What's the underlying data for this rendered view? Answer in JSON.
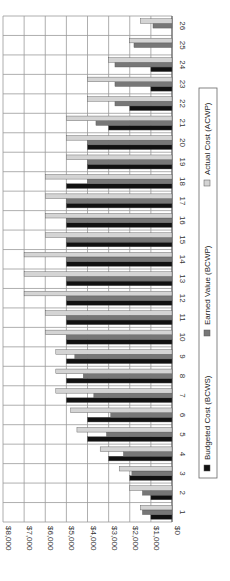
{
  "chart_data": {
    "type": "bar",
    "orientation": "rotated-90-clockwise",
    "title": "",
    "xlabel": "",
    "ylabel": "",
    "ylim": [
      0,
      8000
    ],
    "grid": true,
    "legend_position": "bottom",
    "categories": [
      "1",
      "2",
      "3",
      "4",
      "5",
      "6",
      "7",
      "8",
      "9",
      "10",
      "11",
      "12",
      "13",
      "14",
      "15",
      "16",
      "17",
      "18",
      "19",
      "20",
      "21",
      "22",
      "23",
      "24",
      "25",
      "26"
    ],
    "y_ticks": [
      "$0",
      "$1,000",
      "$2,000",
      "$3,000",
      "$4,000",
      "$5,000",
      "$6,000",
      "$7,000",
      "$8,000"
    ],
    "series": [
      {
        "name": "Budgeted Cost (BCWS)",
        "color": "#111111",
        "values": [
          1000,
          1000,
          2000,
          3000,
          4000,
          4000,
          5000,
          5000,
          5000,
          5000,
          5000,
          5000,
          5000,
          5000,
          5000,
          5000,
          5000,
          5000,
          4000,
          4000,
          3000,
          2000,
          1000,
          1000,
          null,
          null
        ]
      },
      {
        "name": "Earned Value (BCWP)",
        "color": "#777777",
        "values": [
          1400,
          1400,
          1900,
          2300,
          3100,
          2900,
          3700,
          4200,
          4600,
          5000,
          5000,
          5000,
          5000,
          5000,
          5000,
          5000,
          5000,
          4000,
          4000,
          4000,
          3600,
          2700,
          2700,
          2700,
          1800,
          900
        ]
      },
      {
        "name": "Actual Cost (ACWP)",
        "color": "#d4d4d4",
        "values": [
          1500,
          2000,
          2500,
          3400,
          4500,
          4800,
          5500,
          5500,
          5500,
          6000,
          6000,
          7000,
          7000,
          7000,
          6000,
          6000,
          6000,
          6000,
          5000,
          5000,
          5000,
          4000,
          4000,
          3000,
          2000,
          1500
        ]
      }
    ]
  }
}
